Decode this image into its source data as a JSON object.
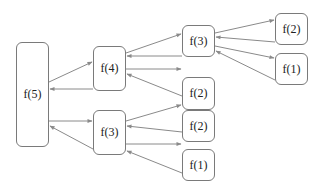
{
  "diagram": {
    "title": "",
    "colors": {
      "stroke": "#7a7a7a",
      "edge": "#8a8a8a",
      "text": "#222222",
      "background": "#ffffff"
    },
    "nodes": [
      {
        "id": "n5",
        "label": "f(5)",
        "x": 16,
        "y": 42,
        "w": 33,
        "h": 105
      },
      {
        "id": "n4",
        "label": "f(4)",
        "x": 93,
        "y": 46,
        "w": 33,
        "h": 45
      },
      {
        "id": "n3b",
        "label": "f(3)",
        "x": 93,
        "y": 110,
        "w": 33,
        "h": 45
      },
      {
        "id": "n3a",
        "label": "f(3)",
        "x": 182,
        "y": 25,
        "w": 33,
        "h": 32
      },
      {
        "id": "n2a",
        "label": "f(2)",
        "x": 182,
        "y": 77,
        "w": 33,
        "h": 33
      },
      {
        "id": "n2b",
        "label": "f(2)",
        "x": 182,
        "y": 110,
        "w": 33,
        "h": 32
      },
      {
        "id": "n1b",
        "label": "f(1)",
        "x": 182,
        "y": 149,
        "w": 33,
        "h": 32
      },
      {
        "id": "n2c",
        "label": "f(2)",
        "x": 275,
        "y": 13,
        "w": 33,
        "h": 32
      },
      {
        "id": "n1c",
        "label": "f(1)",
        "x": 275,
        "y": 53,
        "w": 33,
        "h": 32
      }
    ],
    "edges": [
      {
        "type": "call",
        "from": "n5",
        "to": "n4",
        "x1": 49,
        "y1": 82,
        "x2": 92,
        "y2": 62
      },
      {
        "type": "return",
        "from": "n4",
        "to": "n5",
        "x1": 93,
        "y1": 89,
        "x2": 50,
        "y2": 89
      },
      {
        "type": "call",
        "from": "n5",
        "to": "n3b",
        "x1": 49,
        "y1": 121,
        "x2": 92,
        "y2": 121
      },
      {
        "type": "return",
        "from": "n3b",
        "to": "n5",
        "x1": 93,
        "y1": 149,
        "x2": 50,
        "y2": 126
      },
      {
        "type": "call",
        "from": "n4",
        "to": "n3a",
        "x1": 126,
        "y1": 53,
        "x2": 181,
        "y2": 34
      },
      {
        "type": "return",
        "from": "n3a",
        "to": "n4",
        "x1": 182,
        "y1": 56,
        "x2": 127,
        "y2": 56
      },
      {
        "type": "call",
        "from": "n4",
        "to": "n2a",
        "x1": 126,
        "y1": 69,
        "x2": 181,
        "y2": 69
      },
      {
        "type": "return",
        "from": "n2a",
        "to": "n4",
        "x1": 182,
        "y1": 96,
        "x2": 127,
        "y2": 74
      },
      {
        "type": "call",
        "from": "n3b",
        "to": "n2b",
        "x1": 126,
        "y1": 121,
        "x2": 181,
        "y2": 105
      },
      {
        "type": "return",
        "from": "n2b",
        "to": "n3b",
        "x1": 182,
        "y1": 132,
        "x2": 127,
        "y2": 126
      },
      {
        "type": "call",
        "from": "n3b",
        "to": "n1b",
        "x1": 126,
        "y1": 144,
        "x2": 181,
        "y2": 144
      },
      {
        "type": "return",
        "from": "n1b",
        "to": "n3b",
        "x1": 182,
        "y1": 173,
        "x2": 127,
        "y2": 151
      },
      {
        "type": "call",
        "from": "n3a",
        "to": "n2c",
        "x1": 215,
        "y1": 33,
        "x2": 274,
        "y2": 20
      },
      {
        "type": "return",
        "from": "n2c",
        "to": "n3a",
        "x1": 275,
        "y1": 42,
        "x2": 216,
        "y2": 37
      },
      {
        "type": "call",
        "from": "n3a",
        "to": "n1c",
        "x1": 215,
        "y1": 46,
        "x2": 274,
        "y2": 58
      },
      {
        "type": "return",
        "from": "n1c",
        "to": "n3a",
        "x1": 275,
        "y1": 80,
        "x2": 216,
        "y2": 51
      }
    ]
  }
}
